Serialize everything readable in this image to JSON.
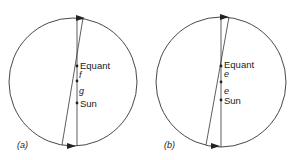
{
  "diagram": {
    "panels": [
      {
        "id": "a",
        "caption": "(a)",
        "circle": {
          "cx": 73,
          "cy": 82,
          "r": 64
        },
        "vertical_line": {
          "x1": 77,
          "y1": 18,
          "x2": 77,
          "y2": 146
        },
        "slanted_line": {
          "x1": 83,
          "y1": 18,
          "x2": 62,
          "y2": 145
        },
        "points": [
          {
            "name": "equant",
            "label": "Equant",
            "x": 77,
            "y": 66
          },
          {
            "name": "f",
            "label": "f",
            "x": 77,
            "y": 81
          },
          {
            "name": "sun",
            "label": "Sun",
            "x": 77,
            "y": 103
          }
        ],
        "segment_labels": [
          "f",
          "g"
        ],
        "labels": {
          "equant": "Equant",
          "f": "f",
          "g": "g",
          "sun": "Sun"
        }
      },
      {
        "id": "b",
        "caption": "(b)",
        "circle": {
          "cx": 221,
          "cy": 82,
          "r": 65
        },
        "vertical_line": {
          "x1": 221,
          "y1": 17,
          "x2": 221,
          "y2": 147
        },
        "slanted_line": {
          "x1": 229,
          "y1": 17,
          "x2": 206,
          "y2": 145
        },
        "points": [
          {
            "name": "equant",
            "label": "Equant",
            "x": 221,
            "y": 66
          },
          {
            "name": "e",
            "label": "e",
            "x": 221,
            "y": 82
          },
          {
            "name": "sun",
            "label": "Sun",
            "x": 221,
            "y": 100
          }
        ],
        "segment_labels": [
          "e",
          "e"
        ],
        "labels": {
          "equant": "Equant",
          "e1": "e",
          "e2": "e",
          "sun": "Sun"
        }
      }
    ],
    "colors": {
      "stroke": "#333333",
      "text": "#222222",
      "background": "#ffffff"
    }
  }
}
